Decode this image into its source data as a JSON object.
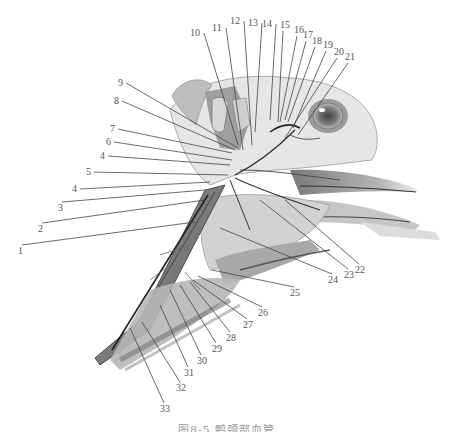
{
  "figure": {
    "type": "anatomical-illustration",
    "caption": "图8-5  鸭颈部血管"
  },
  "labels": [
    {
      "num": "1",
      "x": 18,
      "y": 254,
      "tx": 195,
      "ty": 222
    },
    {
      "num": "2",
      "x": 38,
      "y": 232,
      "tx": 205,
      "ty": 200
    },
    {
      "num": "3",
      "x": 58,
      "y": 211,
      "tx": 205,
      "ty": 190
    },
    {
      "num": "4",
      "x": 72,
      "y": 192,
      "tx": 210,
      "ty": 182
    },
    {
      "num": "5",
      "x": 86,
      "y": 175,
      "tx": 228,
      "ty": 175
    },
    {
      "num": "4",
      "x": 100,
      "y": 159,
      "tx": 230,
      "ty": 165
    },
    {
      "num": "6",
      "x": 106,
      "y": 145,
      "tx": 232,
      "ty": 160
    },
    {
      "num": "7",
      "x": 110,
      "y": 132,
      "tx": 232,
      "ty": 153
    },
    {
      "num": "8",
      "x": 114,
      "y": 104,
      "tx": 235,
      "ty": 150
    },
    {
      "num": "9",
      "x": 118,
      "y": 86,
      "tx": 238,
      "ty": 148
    },
    {
      "num": "10",
      "x": 190,
      "y": 36,
      "tx": 238,
      "ty": 145
    },
    {
      "num": "11",
      "x": 212,
      "y": 31,
      "tx": 243,
      "ty": 150
    },
    {
      "num": "12",
      "x": 230,
      "y": 24,
      "tx": 252,
      "ty": 145
    },
    {
      "num": "13",
      "x": 248,
      "y": 26,
      "tx": 255,
      "ty": 132
    },
    {
      "num": "14",
      "x": 262,
      "y": 27,
      "tx": 270,
      "ty": 120
    },
    {
      "num": "15",
      "x": 280,
      "y": 28,
      "tx": 278,
      "ty": 122
    },
    {
      "num": "16",
      "x": 294,
      "y": 33,
      "tx": 280,
      "ty": 122
    },
    {
      "num": "17",
      "x": 303,
      "y": 38,
      "tx": 285,
      "ty": 120
    },
    {
      "num": "18",
      "x": 312,
      "y": 44,
      "tx": 288,
      "ty": 122
    },
    {
      "num": "19",
      "x": 323,
      "y": 48,
      "tx": 293,
      "ty": 128
    },
    {
      "num": "20",
      "x": 334,
      "y": 55,
      "tx": 285,
      "ty": 138
    },
    {
      "num": "21",
      "x": 345,
      "y": 60,
      "tx": 298,
      "ty": 135
    },
    {
      "num": "22",
      "x": 355,
      "y": 273,
      "tx": 285,
      "ty": 200
    },
    {
      "num": "23",
      "x": 344,
      "y": 278,
      "tx": 260,
      "ty": 200
    },
    {
      "num": "24",
      "x": 328,
      "y": 283,
      "tx": 220,
      "ty": 228
    },
    {
      "num": "25",
      "x": 290,
      "y": 296,
      "tx": 212,
      "ty": 270
    },
    {
      "num": "26",
      "x": 258,
      "y": 316,
      "tx": 198,
      "ty": 276
    },
    {
      "num": "27",
      "x": 243,
      "y": 328,
      "tx": 193,
      "ty": 280
    },
    {
      "num": "28",
      "x": 226,
      "y": 341,
      "tx": 190,
      "ty": 282
    },
    {
      "num": "29",
      "x": 212,
      "y": 352,
      "tx": 180,
      "ty": 285
    },
    {
      "num": "30",
      "x": 197,
      "y": 364,
      "tx": 170,
      "ty": 290
    },
    {
      "num": "31",
      "x": 184,
      "y": 376,
      "tx": 160,
      "ty": 305
    },
    {
      "num": "32",
      "x": 176,
      "y": 391,
      "tx": 142,
      "ty": 322
    },
    {
      "num": "33",
      "x": 160,
      "y": 412,
      "tx": 130,
      "ty": 328
    }
  ],
  "colors": {
    "background": "#ffffff",
    "sketch_dark": "#3a3a3a",
    "sketch_mid": "#8a8a8a",
    "sketch_light": "#cfcfcf",
    "label_text": "#555555"
  }
}
